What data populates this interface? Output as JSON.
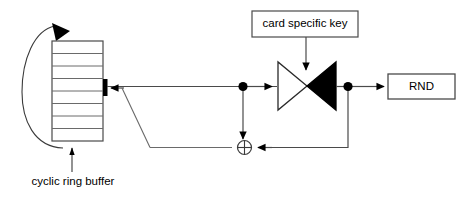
{
  "diagram": {
    "title_text_elements": {
      "card_specific_key": "card specific key",
      "rnd": "RND",
      "cyclic_ring_buffer": "cyclic ring buffer"
    },
    "colors": {
      "stroke": "#1a1a1a",
      "fill_black": "#000000",
      "fill_white": "#ffffff",
      "background": "#ffffff"
    },
    "nodes": [
      {
        "id": "card-specific-key-box",
        "shape": "rectangle",
        "label": "card specific key",
        "x": 252,
        "y": 11,
        "width": 106,
        "height": 26
      },
      {
        "id": "rnd-box",
        "shape": "rectangle",
        "label": "RND",
        "x": 388,
        "y": 74,
        "width": 67,
        "height": 25
      },
      {
        "id": "cyclic-ring-buffer",
        "shape": "stacked-cells-rectangle",
        "label": "cyclic ring buffer",
        "x": 52,
        "y": 41,
        "width": 51,
        "height": 100,
        "cell_count": 8
      },
      {
        "id": "cipher-bowtie",
        "shape": "bowtie",
        "label": "",
        "x": 278,
        "y": 62,
        "width": 58,
        "height": 48,
        "left_triangle_fill": "white",
        "right_triangle_fill": "black"
      },
      {
        "id": "xor-gate",
        "shape": "circle-with-cross",
        "label": "",
        "cx": 245,
        "cy": 148,
        "r": 7
      },
      {
        "id": "write-pointer-bar",
        "shape": "thick-vertical-bar",
        "label": "",
        "x": 105,
        "y": 80,
        "height": 16
      },
      {
        "id": "junction-dot-left",
        "shape": "filled-dot",
        "cx": 243,
        "cy": 86,
        "r": 4.5
      },
      {
        "id": "junction-dot-right",
        "shape": "filled-dot",
        "cx": 348,
        "cy": 86,
        "r": 4.5
      }
    ],
    "edges": [
      {
        "id": "edge-buffer-to-cipher",
        "from": "write-pointer-bar",
        "to": "cipher-bowtie",
        "style": "solid",
        "arrow": "both-directions-split"
      },
      {
        "id": "edge-feedback-into-buffer",
        "from": "bottom-bus",
        "to": "write-pointer-bar",
        "style": "solid",
        "arrow": "left"
      },
      {
        "id": "edge-key-to-cipher",
        "from": "card-specific-key-box",
        "to": "cipher-bowtie",
        "style": "solid",
        "arrow": "down"
      },
      {
        "id": "edge-cipher-to-rnd",
        "from": "cipher-bowtie",
        "to": "rnd-box",
        "style": "solid",
        "arrow": "right"
      },
      {
        "id": "edge-dot-left-to-xor",
        "from": "junction-dot-left",
        "to": "xor-gate",
        "style": "solid",
        "arrow": "down"
      },
      {
        "id": "edge-dot-right-to-xor",
        "from": "junction-dot-right",
        "to": "xor-gate",
        "style": "solid",
        "arrow": "left"
      },
      {
        "id": "edge-xor-to-buffer-diagonal",
        "from": "xor-gate",
        "to": "write-pointer-bar",
        "style": "solid-polyline",
        "arrow": "none"
      },
      {
        "id": "edge-cyclic-loop",
        "from": "cyclic-ring-buffer-bottom",
        "to": "cyclic-ring-buffer-top",
        "style": "curved-arc",
        "arrow": "down-right"
      },
      {
        "id": "edge-buffer-annotation",
        "from": "cyclic-ring-buffer-label",
        "to": "cyclic-ring-buffer",
        "style": "solid",
        "arrow": "up"
      }
    ]
  }
}
